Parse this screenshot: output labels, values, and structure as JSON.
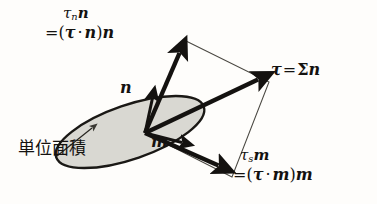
{
  "figure": {
    "background_color": "#fefdfb",
    "ink_color": "#141210",
    "plane_fill_color": "#d9d8d2"
  },
  "labels": {
    "normal_component": {
      "name": "tau-n-n",
      "line1_tau": "τ",
      "line1_sub": "n",
      "line1_vec": "n",
      "line2_eq": "=",
      "line2_open": "(",
      "line2_tau": "τ",
      "line2_dot": "·",
      "line2_n": "n",
      "line2_close": ")",
      "line2_n2": "n",
      "plain_text": "τₙn = (τ · n) n"
    },
    "shear_component": {
      "name": "tau-s-m",
      "line1_tau": "τ",
      "line1_sub": "s",
      "line1_vec": "m",
      "line2_eq": "=",
      "line2_open": "(",
      "line2_tau": "τ",
      "line2_dot": "·",
      "line2_m": "m",
      "line2_close": ")",
      "line2_m2": "m",
      "plain_text": "τₛm = (τ · m) m"
    },
    "traction": {
      "name": "tau-equals-sigma-n",
      "tau": "τ",
      "equals": "=",
      "sigma": "Σ",
      "n": "n",
      "plain_text": "τ = Σn"
    },
    "normal_unit_vector": {
      "name": "n",
      "text": "n"
    },
    "tangent_unit_vector": {
      "name": "m",
      "text": "m"
    },
    "unit_area": {
      "name": "unit-area-japanese",
      "text": "単位面積",
      "translation_note": "unit area"
    }
  },
  "geometry": {
    "origin": {
      "x": 145,
      "y": 133
    },
    "plane_ellipse": {
      "cx": 130,
      "cy": 132,
      "rx": 78,
      "ry": 27,
      "rotation_deg": -19
    },
    "vectors": [
      {
        "name": "tau-n-n-arrow",
        "from": [
          145,
          133
        ],
        "to": [
          180,
          48
        ],
        "style": "bold"
      },
      {
        "name": "tau-arrow",
        "from": [
          145,
          133
        ],
        "to": [
          263,
          77
        ],
        "style": "bold"
      },
      {
        "name": "tau-s-m-arrow",
        "from": [
          145,
          133
        ],
        "to": [
          223,
          168
        ],
        "style": "bold"
      },
      {
        "name": "n-unit-arrow",
        "from": [
          145,
          133
        ],
        "to": [
          155,
          92
        ],
        "style": "bold-short"
      },
      {
        "name": "m-unit-arrow",
        "from": [
          145,
          133
        ],
        "to": [
          188,
          144
        ],
        "style": "bold-short"
      }
    ],
    "parallelogram": {
      "points": [
        [
          145,
          133
        ],
        [
          186,
          41
        ],
        [
          269,
          82
        ],
        [
          232,
          177
        ]
      ],
      "stroke": "thin"
    },
    "leader_arrow": {
      "name": "unit-area-leader",
      "from": [
        58,
        155
      ],
      "to": [
        92,
        128
      ]
    }
  }
}
